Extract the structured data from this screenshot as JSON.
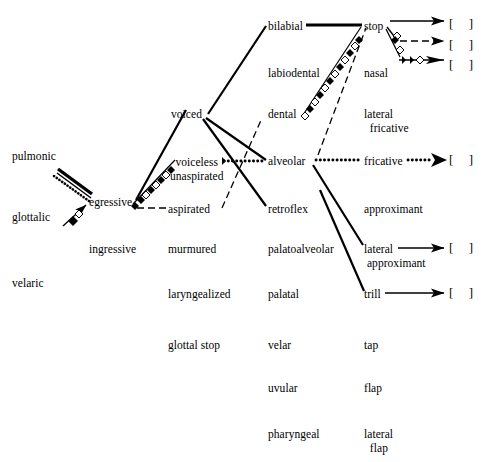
{
  "diagram": {
    "ink_color": "#000000",
    "background": "#ffffff",
    "columns": {
      "airstream_mechanism": {
        "name": "airstream mechanism",
        "items": [
          {
            "id": "pulmonic",
            "label": "pulmonic",
            "x": 12,
            "y": 150
          },
          {
            "id": "glottalic",
            "label": "glottalic",
            "x": 12,
            "y": 211
          },
          {
            "id": "velaric",
            "label": "velaric",
            "x": 12,
            "y": 277
          }
        ]
      },
      "airstream_direction": {
        "name": "airstream direction",
        "items": [
          {
            "id": "egressive",
            "label": "egressive",
            "x": 89,
            "y": 196
          },
          {
            "id": "ingressive",
            "label": "ingressive",
            "x": 89,
            "y": 243
          }
        ]
      },
      "phonation": {
        "name": "phonation type",
        "items": [
          {
            "id": "voiced",
            "label": "voiced",
            "x": 171,
            "y": 108
          },
          {
            "id": "voiceless-unaspirated",
            "label": "voiceless\nunaspirated",
            "x": 170,
            "y": 156
          },
          {
            "id": "aspirated",
            "label": "aspirated",
            "x": 168,
            "y": 203
          },
          {
            "id": "murmured",
            "label": "murmured",
            "x": 168,
            "y": 243
          },
          {
            "id": "laryngealized",
            "label": "laryngealized",
            "x": 168,
            "y": 288
          },
          {
            "id": "glottal-stop",
            "label": "glottal stop",
            "x": 168,
            "y": 339
          }
        ]
      },
      "place_of_articulation": {
        "name": "place of articulation",
        "items": [
          {
            "id": "bilabial",
            "label": "bilabial",
            "x": 268,
            "y": 20
          },
          {
            "id": "labiodental",
            "label": "labiodental",
            "x": 268,
            "y": 67
          },
          {
            "id": "dental",
            "label": "dental",
            "x": 268,
            "y": 108
          },
          {
            "id": "alveolar",
            "label": "alveolar",
            "x": 268,
            "y": 155
          },
          {
            "id": "retroflex",
            "label": "retroflex",
            "x": 268,
            "y": 203
          },
          {
            "id": "palatoalveolar",
            "label": "palatoalveolar",
            "x": 268,
            "y": 243
          },
          {
            "id": "palatal",
            "label": "palatal",
            "x": 268,
            "y": 288
          },
          {
            "id": "velar",
            "label": "velar",
            "x": 268,
            "y": 339
          },
          {
            "id": "uvular",
            "label": "uvular",
            "x": 268,
            "y": 382
          },
          {
            "id": "pharyngeal",
            "label": "pharyngeal",
            "x": 268,
            "y": 428
          }
        ]
      },
      "manner_of_articulation": {
        "name": "manner of articulation",
        "items": [
          {
            "id": "stop",
            "label": "stop",
            "x": 364,
            "y": 20
          },
          {
            "id": "nasal",
            "label": "nasal",
            "x": 364,
            "y": 67
          },
          {
            "id": "fricative",
            "label": "fricative",
            "x": 364,
            "y": 108
          },
          {
            "id": "lateral-fricative",
            "label": "lateral\n  fricative",
            "x": 364,
            "y": 155
          },
          {
            "id": "approximant",
            "label": "approximant",
            "x": 364,
            "y": 203
          },
          {
            "id": "lateral-approximant",
            "label": "lateral\n approximant",
            "x": 364,
            "y": 243
          },
          {
            "id": "trill",
            "label": "trill",
            "x": 364,
            "y": 288
          },
          {
            "id": "tap",
            "label": "tap",
            "x": 364,
            "y": 339
          },
          {
            "id": "flap",
            "label": "flap",
            "x": 364,
            "y": 382
          },
          {
            "id": "lateral-flap",
            "label": "lateral\n  flap",
            "x": 364,
            "y": 428
          }
        ]
      }
    },
    "outputs": [
      {
        "id": "output-stop-1",
        "label": "[    ]",
        "x": 449,
        "y": 16
      },
      {
        "id": "output-stop-2",
        "label": "[    ]",
        "x": 449,
        "y": 37
      },
      {
        "id": "output-stop-3",
        "label": "[    ]",
        "x": 449,
        "y": 57
      },
      {
        "id": "output-lateral-fricative",
        "label": "[    ]",
        "x": 449,
        "y": 152
      },
      {
        "id": "output-lateral-approximant",
        "label": "[    ]",
        "x": 449,
        "y": 240
      },
      {
        "id": "output-trill",
        "label": "[    ]",
        "x": 449,
        "y": 285
      }
    ],
    "edges": [
      {
        "id": "edge-pulmonic-egressive-solid",
        "style": "solid-thick",
        "from": "pulmonic",
        "to": "egressive"
      },
      {
        "id": "edge-pulmonic-egressive-dotted",
        "style": "dotted",
        "from": "pulmonic",
        "to": "egressive"
      },
      {
        "id": "edge-glottalic-egressive",
        "style": "beaded",
        "from": "glottalic",
        "to": "egressive"
      },
      {
        "id": "edge-egressive-voiced",
        "style": "solid",
        "from": "egressive",
        "to": "voiced"
      },
      {
        "id": "edge-egressive-voiceless",
        "style": "beaded",
        "from": "egressive",
        "to": "voiceless-unaspirated"
      },
      {
        "id": "edge-egressive-aspirated",
        "style": "dashed",
        "from": "egressive",
        "to": "aspirated"
      },
      {
        "id": "edge-voiced-bilabial",
        "style": "solid",
        "from": "voiced",
        "to": "bilabial"
      },
      {
        "id": "edge-voiced-alveolar",
        "style": "solid",
        "from": "voiced",
        "to": "alveolar"
      },
      {
        "id": "edge-voiced-retroflex",
        "style": "solid",
        "from": "voiced",
        "to": "retroflex"
      },
      {
        "id": "edge-voiceless-alveolar",
        "style": "dotted",
        "from": "voiceless-unaspirated",
        "to": "alveolar"
      },
      {
        "id": "edge-aspirated-dental",
        "style": "dashed",
        "from": "aspirated",
        "to": "dental"
      },
      {
        "id": "edge-bilabial-stop",
        "style": "solid-thick",
        "from": "bilabial",
        "to": "stop"
      },
      {
        "id": "edge-dental-stop",
        "style": "beaded",
        "from": "dental",
        "to": "stop"
      },
      {
        "id": "edge-alveolar-stop",
        "style": "dashed",
        "from": "alveolar",
        "to": "stop"
      },
      {
        "id": "edge-alveolar-lateral-fricative",
        "style": "dotted",
        "from": "alveolar",
        "to": "lateral-fricative"
      },
      {
        "id": "edge-alveolar-lateral-approximant",
        "style": "solid",
        "from": "alveolar",
        "to": "lateral-approximant"
      },
      {
        "id": "edge-alveolar-trill",
        "style": "solid",
        "from": "alveolar",
        "to": "trill"
      },
      {
        "id": "edge-stop-output-1",
        "style": "solid-arrow",
        "from": "stop",
        "to": "output-stop-1"
      },
      {
        "id": "edge-stop-output-2",
        "style": "dashed-arrow",
        "from": "stop",
        "to": "output-stop-2"
      },
      {
        "id": "edge-stop-output-3",
        "style": "beaded-arrow",
        "from": "stop",
        "to": "output-stop-3"
      },
      {
        "id": "edge-lateral-fricative-output",
        "style": "dotted-arrow",
        "from": "lateral-fricative",
        "to": "output-lateral-fricative"
      },
      {
        "id": "edge-lateral-approximant-output",
        "style": "solid-arrow",
        "from": "lateral-approximant",
        "to": "output-lateral-approximant"
      },
      {
        "id": "edge-trill-output",
        "style": "solid-arrow",
        "from": "trill",
        "to": "output-trill"
      }
    ]
  }
}
